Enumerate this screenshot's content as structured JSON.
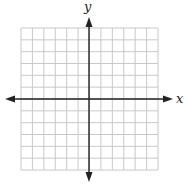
{
  "diagram": {
    "type": "coordinate-grid",
    "axes": {
      "x_label": "x",
      "y_label": "y",
      "color": "#222222"
    },
    "grid": {
      "columns": 12,
      "rows": 12,
      "columns_left_of_origin": 6,
      "columns_right_of_origin": 6,
      "rows_above_origin": 6,
      "rows_below_origin": 6,
      "line_color": "#c8c8c8",
      "labels_on_ticks": false
    }
  }
}
